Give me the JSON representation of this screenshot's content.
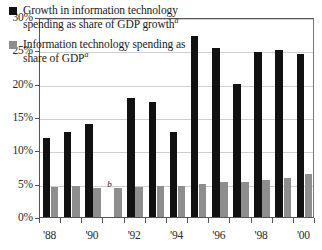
{
  "chart_data": {
    "type": "bar",
    "title": "",
    "xlabel": "",
    "ylabel": "",
    "ylim": [
      0,
      30
    ],
    "ytick_labels": [
      "0%",
      "5%",
      "10%",
      "15%",
      "20%",
      "25%",
      "30%"
    ],
    "ytick_values": [
      0,
      5,
      10,
      15,
      20,
      25,
      30
    ],
    "grid": true,
    "legend_position": "upper-left",
    "categories": [
      "1988",
      "1989",
      "1990",
      "1991",
      "1992",
      "1993",
      "1994",
      "1995",
      "1996",
      "1997",
      "1998",
      "1999",
      "2000"
    ],
    "xtick_labels": [
      "'88",
      "'90",
      "'92",
      "'94",
      "'96",
      "'98",
      "'00"
    ],
    "xtick_categories": [
      "1988",
      "1990",
      "1992",
      "1994",
      "1996",
      "1998",
      "2000"
    ],
    "series": [
      {
        "name": "Growth in information technology spending as share of GDP growth",
        "footnote_marker": "a",
        "color": "#111111",
        "values": [
          11.8,
          12.7,
          13.9,
          null,
          17.8,
          17.3,
          12.7,
          27.1,
          25.4,
          20.0,
          24.8,
          25.1,
          24.5
        ]
      },
      {
        "name": "Information technology spending as share of GDP",
        "footnote_marker": "a",
        "color": "#8e8e8e",
        "values": [
          4.5,
          4.6,
          4.4,
          4.4,
          4.5,
          4.6,
          4.7,
          4.9,
          5.2,
          5.3,
          5.5,
          5.9,
          6.4
        ]
      }
    ],
    "annotations": [
      {
        "text": "b",
        "category": "1991",
        "series": "Growth in information technology spending as share of GDP growth",
        "note": "value not available / not meaningful"
      }
    ]
  },
  "legend": {
    "entries": [
      {
        "label": "Growth in information technology spending as share of GDP growth",
        "superscript": "a",
        "swatch": "black-square-swatch"
      },
      {
        "label": "Information technology spending as share of GDP",
        "superscript": "a",
        "swatch": "gray-square-swatch"
      }
    ]
  },
  "colors": {
    "growth_bar": "#111111",
    "share_bar": "#8e8e8e",
    "gridline": "#cfcfcf",
    "axis": "#555555",
    "text": "#1a1a1a",
    "background": "#ffffff"
  }
}
